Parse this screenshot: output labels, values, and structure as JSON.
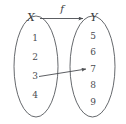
{
  "figure": {
    "type": "function-mapping-diagram",
    "background_color": "#ffffff",
    "line_color": "#55585c",
    "text_color": "#3a3c40"
  },
  "domain_set": {
    "label": "X",
    "elements": [
      "1",
      "2",
      "3",
      "4"
    ]
  },
  "codomain_set": {
    "label": "Y",
    "elements": [
      "5",
      "6",
      "7",
      "8",
      "9"
    ]
  },
  "mapping": {
    "function_label": "f",
    "arrows": [
      {
        "from": "3",
        "to": "7"
      }
    ]
  }
}
